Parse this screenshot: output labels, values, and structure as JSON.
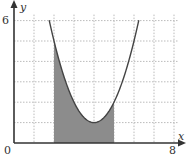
{
  "chart_data": {
    "type": "area",
    "title": "",
    "xlabel": "x",
    "ylabel": "y",
    "xlim": [
      0,
      8
    ],
    "ylim": [
      0,
      6
    ],
    "x_tick_labels": [
      "0",
      "8"
    ],
    "y_tick_labels": [
      "6"
    ],
    "grid": true,
    "grid_style": "dotted",
    "curve": {
      "equation": "y = (x - 4)^2 + 1",
      "domain": [
        1.76,
        6.24
      ],
      "vertex": [
        4,
        1
      ]
    },
    "shaded_region": {
      "x_from": 2,
      "x_to": 5,
      "description": "area under the curve between x = 2 and x = 5"
    },
    "x": [
      2,
      3,
      4,
      5,
      6
    ],
    "series": [
      {
        "name": "curve",
        "values": [
          5,
          2,
          1,
          2,
          5
        ]
      }
    ]
  },
  "colors": {
    "axis": "#333333",
    "curve": "#444444",
    "shade": "#8c8c8c",
    "grid": "#bbbbbb"
  },
  "labels": {
    "origin": "0",
    "x_max": "8",
    "y_max": "6",
    "x_axis": "x",
    "y_axis": "y"
  }
}
